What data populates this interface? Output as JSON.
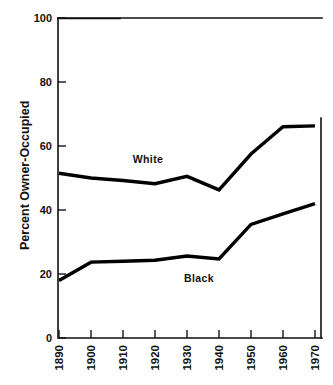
{
  "chart_data": {
    "type": "line",
    "title": "",
    "subtitle": "",
    "xlabel": "",
    "ylabel": "Percent Owner-Occupied",
    "categories": [
      "1890",
      "1900",
      "1910",
      "1920",
      "1930",
      "1940",
      "1950",
      "1960",
      "1970"
    ],
    "x": [
      1890,
      1900,
      1910,
      1920,
      1930,
      1940,
      1950,
      1960,
      1970
    ],
    "xlim": [
      1890,
      1970
    ],
    "ylim": [
      0,
      100
    ],
    "ytick_labels": [
      "0",
      "20",
      "40",
      "60",
      "80",
      "100"
    ],
    "ytick_values": [
      0,
      20,
      40,
      60,
      80,
      100
    ],
    "xtick_labels": [
      "1890",
      "1900",
      "1910",
      "1920",
      "1930",
      "1940",
      "1950",
      "1960",
      "1970"
    ],
    "grid": false,
    "legend_position": "inline-annotation",
    "series": [
      {
        "name": "White",
        "label": "White",
        "color": "#000000",
        "values": [
          51.5,
          50.0,
          49.2,
          48.2,
          50.5,
          46.3,
          57.5,
          66.0,
          66.3
        ],
        "annotation": {
          "text": "White",
          "x": 1920,
          "y": 58
        }
      },
      {
        "name": "Black",
        "label": "Black",
        "color": "#000000",
        "values": [
          18.0,
          23.7,
          24.0,
          24.3,
          25.6,
          24.7,
          35.5,
          38.8,
          42.0
        ],
        "annotation": {
          "text": "Black",
          "x": 1930,
          "y": 21
        }
      }
    ],
    "annotations": [
      {
        "name": "white-series-label",
        "text": "White"
      },
      {
        "name": "black-series-label",
        "text": "Black"
      }
    ]
  },
  "axes": {
    "y_title": "Percent Owner-Occupied",
    "y_ticks": [
      "100",
      "80",
      "60",
      "40",
      "20",
      "0"
    ],
    "x_ticks": [
      "1890",
      "1900",
      "1910",
      "1920",
      "1930",
      "1940",
      "1950",
      "1960",
      "1970"
    ]
  },
  "labels": {
    "white": "White",
    "black": "Black"
  },
  "colors": {
    "line": "#000000",
    "axis": "#111111",
    "background": "#ffffff"
  }
}
